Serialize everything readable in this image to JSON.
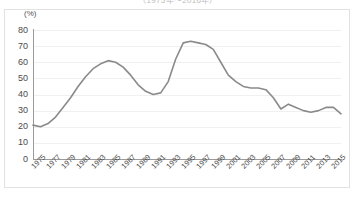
{
  "figure": {
    "title": "（1975年～2016年）",
    "unit_label": "(%)",
    "line_color": "#8a8a8a",
    "grid_color": "#f0f0f0",
    "axis_color": "#9a9a9a",
    "background": "#ffffff"
  },
  "chart_data": {
    "type": "line",
    "title": "（1975年～2016年）",
    "xlabel": "",
    "ylabel": "(%)",
    "ylim": [
      0,
      80
    ],
    "ytick_step": 10,
    "yticks": [
      0,
      10,
      20,
      30,
      40,
      50,
      60,
      70,
      80
    ],
    "grid": true,
    "legend": "none",
    "x": [
      1975,
      1976,
      1977,
      1978,
      1979,
      1980,
      1981,
      1982,
      1983,
      1984,
      1985,
      1986,
      1987,
      1988,
      1989,
      1990,
      1991,
      1992,
      1993,
      1994,
      1995,
      1996,
      1997,
      1998,
      1999,
      2000,
      2001,
      2002,
      2003,
      2004,
      2005,
      2006,
      2007,
      2008,
      2009,
      2010,
      2011,
      2012,
      2013,
      2014,
      2015,
      2016
    ],
    "xtick_labels": [
      "1975",
      "1977",
      "1979",
      "1981",
      "1983",
      "1985",
      "1987",
      "1989",
      "1991",
      "1993",
      "1995",
      "1997",
      "1999",
      "2001",
      "2003",
      "2005",
      "2007",
      "2009",
      "2011",
      "2013",
      "2015"
    ],
    "series": [
      {
        "name": "割合",
        "color": "#8a8a8a",
        "values": [
          21,
          20,
          22,
          26,
          32,
          38,
          45,
          51,
          56,
          59,
          61,
          60,
          57,
          52,
          46,
          42,
          40,
          41,
          48,
          62,
          72,
          73,
          72,
          71,
          68,
          60,
          52,
          48,
          45,
          44,
          44,
          43,
          38,
          31,
          34,
          32,
          30,
          29,
          30,
          32,
          32,
          28
        ]
      }
    ]
  }
}
